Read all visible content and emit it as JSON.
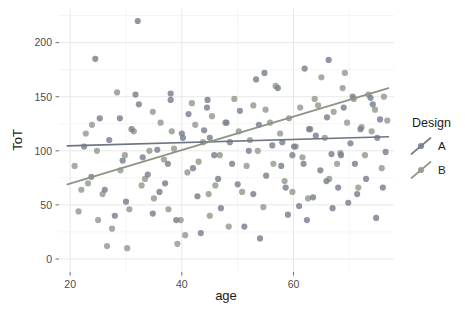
{
  "chart_data": {
    "type": "scatter",
    "title": "",
    "xlabel": "age",
    "ylabel": "ToT",
    "xlim": [
      18,
      78
    ],
    "ylim": [
      -12,
      232
    ],
    "xticks": [
      20,
      40,
      60
    ],
    "yticks": [
      0,
      50,
      100,
      150,
      200
    ],
    "xminor": [
      30,
      50,
      70
    ],
    "yminor": [
      25,
      75,
      125,
      175,
      225
    ],
    "grid": true,
    "legend": {
      "title": "Design",
      "position": "right",
      "entries": [
        {
          "label": "A",
          "color": "#78808f"
        },
        {
          "label": "B",
          "color": "#939a8b"
        }
      ]
    },
    "series": [
      {
        "name": "A",
        "color": "#78808f",
        "trend": {
          "x0": 19.5,
          "y0": 104.5,
          "x1": 77.0,
          "y1": 113.0,
          "color": "#6e7685"
        },
        "points": [
          [
            32.1,
            220.0
          ],
          [
            24.5,
            185.0
          ],
          [
            25.3,
            130.0
          ],
          [
            28.9,
            130.0
          ],
          [
            31.7,
            152.0
          ],
          [
            32.3,
            143.0
          ],
          [
            38.0,
            153.0
          ],
          [
            38.0,
            147.0
          ],
          [
            41.2,
            134.0
          ],
          [
            44.6,
            147.0
          ],
          [
            44.5,
            140.0
          ],
          [
            50.4,
            137.0
          ],
          [
            54.8,
            172.0
          ],
          [
            53.3,
            166.0
          ],
          [
            57.2,
            158.0
          ],
          [
            66.3,
            184.0
          ],
          [
            70.6,
            150.0
          ],
          [
            73.8,
            149.0
          ],
          [
            74.2,
            143.0
          ],
          [
            62.0,
            176.0
          ],
          [
            27.0,
            110.0
          ],
          [
            35.6,
            101.0
          ],
          [
            40.0,
            116.0
          ],
          [
            40.2,
            112.0
          ],
          [
            44.0,
            119.0
          ],
          [
            45.0,
            112.0
          ],
          [
            48.6,
            108.0
          ],
          [
            52.0,
            100.0
          ],
          [
            56.2,
            105.0
          ],
          [
            58.0,
            108.0
          ],
          [
            60.1,
            104.0
          ],
          [
            62.8,
            120.0
          ],
          [
            64.0,
            114.0
          ],
          [
            66.8,
            97.0
          ],
          [
            68.5,
            96.0
          ],
          [
            70.2,
            107.0
          ],
          [
            72.0,
            120.0
          ],
          [
            75.0,
            112.0
          ],
          [
            29.4,
            91.0
          ],
          [
            33.0,
            94.0
          ],
          [
            37.5,
            88.0
          ],
          [
            42.0,
            84.0
          ],
          [
            46.5,
            74.0
          ],
          [
            50.0,
            69.0
          ],
          [
            52.8,
            60.0
          ],
          [
            55.1,
            77.0
          ],
          [
            58.6,
            66.0
          ],
          [
            61.0,
            49.0
          ],
          [
            63.5,
            57.0
          ],
          [
            65.9,
            72.0
          ],
          [
            68.0,
            66.0
          ],
          [
            71.4,
            60.0
          ],
          [
            73.0,
            74.0
          ],
          [
            76.0,
            66.0
          ],
          [
            26.2,
            64.0
          ],
          [
            30.0,
            53.0
          ],
          [
            34.8,
            42.0
          ],
          [
            39.0,
            36.0
          ],
          [
            43.4,
            24.0
          ],
          [
            47.0,
            47.0
          ],
          [
            51.2,
            30.0
          ],
          [
            54.0,
            19.0
          ],
          [
            59.0,
            41.0
          ],
          [
            62.4,
            36.0
          ],
          [
            67.0,
            47.0
          ],
          [
            69.8,
            52.0
          ],
          [
            74.8,
            38.0
          ],
          [
            36.0,
            62.0
          ],
          [
            33.9,
            78.0
          ],
          [
            45.8,
            96.0
          ],
          [
            57.8,
            86.0
          ],
          [
            64.8,
            82.0
          ],
          [
            23.8,
            76.0
          ],
          [
            28.0,
            40.0
          ],
          [
            42.8,
            58.0
          ],
          [
            49.0,
            88.0
          ],
          [
            59.8,
            96.0
          ],
          [
            71.0,
            88.0
          ],
          [
            76.5,
            99.0
          ],
          [
            31.0,
            120.0
          ],
          [
            48.0,
            126.0
          ],
          [
            53.8,
            124.0
          ],
          [
            66.0,
            131.0
          ],
          [
            69.0,
            140.0
          ],
          [
            22.5,
            104.0
          ],
          [
            37.0,
            70.0
          ],
          [
            61.8,
            88.0
          ],
          [
            75.5,
            129.0
          ]
        ]
      },
      {
        "name": "B",
        "color": "#939a8b",
        "trend": {
          "x0": 19.5,
          "y0": 69.0,
          "x1": 77.0,
          "y1": 158.0,
          "color": "#8d9485"
        },
        "points": [
          [
            20.8,
            86.0
          ],
          [
            22.0,
            64.0
          ],
          [
            23.2,
            70.0
          ],
          [
            25.8,
            60.0
          ],
          [
            27.5,
            28.0
          ],
          [
            29.0,
            82.0
          ],
          [
            30.6,
            46.0
          ],
          [
            32.8,
            68.0
          ],
          [
            34.2,
            100.0
          ],
          [
            35.0,
            56.0
          ],
          [
            36.8,
            92.0
          ],
          [
            38.6,
            102.0
          ],
          [
            39.8,
            36.0
          ],
          [
            41.0,
            80.0
          ],
          [
            42.4,
            124.0
          ],
          [
            43.8,
            108.0
          ],
          [
            45.4,
            132.0
          ],
          [
            46.8,
            96.0
          ],
          [
            47.8,
            126.0
          ],
          [
            49.4,
            148.0
          ],
          [
            50.8,
            62.0
          ],
          [
            52.2,
            110.0
          ],
          [
            53.6,
            100.0
          ],
          [
            55.0,
            138.0
          ],
          [
            56.4,
            88.0
          ],
          [
            57.6,
            116.0
          ],
          [
            59.2,
            130.0
          ],
          [
            60.4,
            104.0
          ],
          [
            61.6,
            94.0
          ],
          [
            63.0,
            120.0
          ],
          [
            64.4,
            142.0
          ],
          [
            65.6,
            112.0
          ],
          [
            67.2,
            136.0
          ],
          [
            68.4,
            98.0
          ],
          [
            69.6,
            126.0
          ],
          [
            70.8,
            148.0
          ],
          [
            72.2,
            122.0
          ],
          [
            73.4,
            152.0
          ],
          [
            74.6,
            138.0
          ],
          [
            76.2,
            150.0
          ],
          [
            21.5,
            44.0
          ],
          [
            24.8,
            100.0
          ],
          [
            26.6,
            12.0
          ],
          [
            31.4,
            118.0
          ],
          [
            33.4,
            74.0
          ],
          [
            37.6,
            46.0
          ],
          [
            40.6,
            22.0
          ],
          [
            44.8,
            60.0
          ],
          [
            48.4,
            30.0
          ],
          [
            51.6,
            86.0
          ],
          [
            54.6,
            48.0
          ],
          [
            58.4,
            72.0
          ],
          [
            62.6,
            56.0
          ],
          [
            66.4,
            74.0
          ],
          [
            71.6,
            66.0
          ],
          [
            75.8,
            84.0
          ],
          [
            23.9,
            124.0
          ],
          [
            28.4,
            154.0
          ],
          [
            36.2,
            126.0
          ],
          [
            46.0,
            68.0
          ],
          [
            56.8,
            160.0
          ],
          [
            65.0,
            168.0
          ],
          [
            69.2,
            172.0
          ],
          [
            74.0,
            118.0
          ],
          [
            30.2,
            10.0
          ],
          [
            39.2,
            14.0
          ],
          [
            43.0,
            90.0
          ],
          [
            50.2,
            118.0
          ],
          [
            59.8,
            62.0
          ],
          [
            67.8,
            88.0
          ],
          [
            72.8,
            96.0
          ],
          [
            25.0,
            36.0
          ],
          [
            34.8,
            136.0
          ],
          [
            41.8,
            144.0
          ],
          [
            55.8,
            126.0
          ],
          [
            63.8,
            148.0
          ],
          [
            29.8,
            96.0
          ],
          [
            45.0,
            40.0
          ],
          [
            52.8,
            142.0
          ],
          [
            61.2,
            140.0
          ],
          [
            68.8,
            158.0
          ],
          [
            76.8,
            128.0
          ],
          [
            22.8,
            116.0
          ],
          [
            38.2,
            118.0
          ]
        ]
      }
    ]
  }
}
